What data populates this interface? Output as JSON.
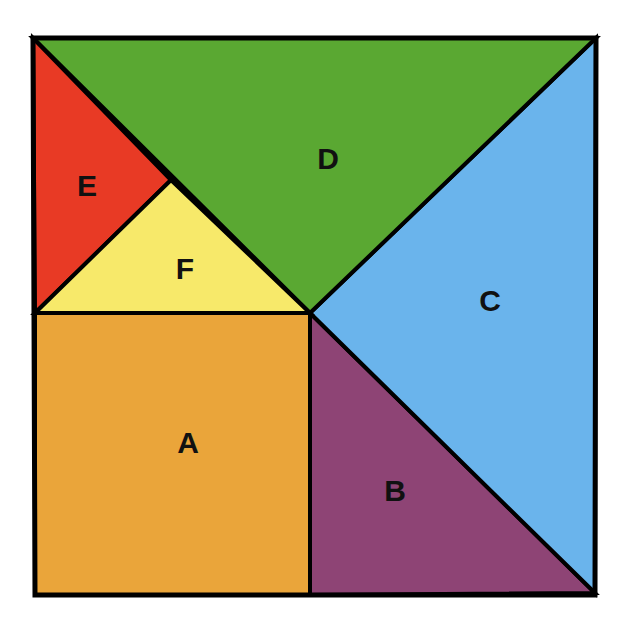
{
  "diagram": {
    "type": "tangram-square-dissection",
    "pieces": [
      {
        "id": "A",
        "label": "A",
        "shape": "square",
        "color": "#eaa53a"
      },
      {
        "id": "B",
        "label": "B",
        "shape": "right-triangle",
        "color": "#8e4475"
      },
      {
        "id": "C",
        "label": "C",
        "shape": "right-triangle",
        "color": "#6ab4ec"
      },
      {
        "id": "D",
        "label": "D",
        "shape": "right-triangle",
        "color": "#5aa832"
      },
      {
        "id": "E",
        "label": "E",
        "shape": "right-triangle",
        "color": "#e83a25"
      },
      {
        "id": "F",
        "label": "F",
        "shape": "right-triangle",
        "color": "#f7e96a"
      }
    ],
    "outline_color": "#000000"
  }
}
